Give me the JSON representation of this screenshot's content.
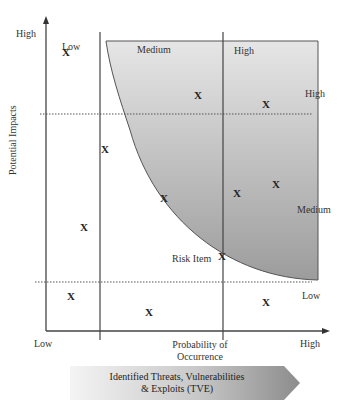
{
  "diagram": {
    "type": "risk-matrix",
    "y_axis": {
      "title": "Potential Impacts",
      "high_label": "High"
    },
    "x_axis": {
      "title_line1": "Probability of",
      "title_line2": "Occurrence",
      "low_label": "Low",
      "high_label": "High"
    },
    "column_labels": {
      "low": "Low",
      "medium": "Medium",
      "high": "High"
    },
    "row_labels": {
      "high": "High",
      "medium": "Medium",
      "low": "Low"
    },
    "risk_item_label": "Risk Item",
    "marker_glyph": "X",
    "banner": {
      "line1": "Identified Threats, Vulnerabilities",
      "line2": "& Exploits (TVE)"
    },
    "colors": {
      "shaded_region_light": "#e4e4e4",
      "shaded_region_dark": "#9a9a9a",
      "axis_line": "#444444",
      "banner_light": "#f2f2f2",
      "banner_dark": "#8f8f8f"
    },
    "markers": [
      {
        "id": "m1",
        "x": 66,
        "y": 52
      },
      {
        "id": "m2",
        "x": 105,
        "y": 149
      },
      {
        "id": "m3",
        "x": 84,
        "y": 227
      },
      {
        "id": "m4",
        "x": 71,
        "y": 296
      },
      {
        "id": "m5",
        "x": 149,
        "y": 312
      },
      {
        "id": "m6",
        "x": 164,
        "y": 198
      },
      {
        "id": "m7",
        "x": 222,
        "y": 256
      },
      {
        "id": "m8",
        "x": 198,
        "y": 95
      },
      {
        "id": "m9",
        "x": 266,
        "y": 104
      },
      {
        "id": "m10",
        "x": 237,
        "y": 193
      },
      {
        "id": "m11",
        "x": 276,
        "y": 184
      },
      {
        "id": "m12",
        "x": 266,
        "y": 302
      }
    ]
  }
}
